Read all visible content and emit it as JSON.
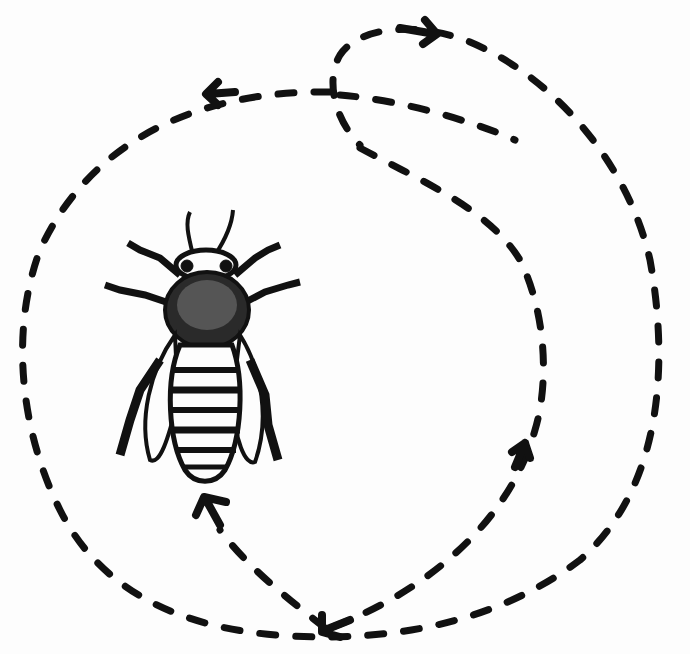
{
  "figure": {
    "subject": "Honeybee round dance",
    "elements": {
      "bee": "bee-illustration",
      "path_outer": "outer-dashed-loop",
      "path_inner": "inner-dashed-loop",
      "arrows": [
        "arrow-top-right",
        "arrow-top-left",
        "arrow-bottom-center",
        "arrow-right-inner",
        "arrow-bottom-to-bee"
      ]
    },
    "colors": {
      "ink": "#111111",
      "background": "#fdfdfd"
    }
  }
}
